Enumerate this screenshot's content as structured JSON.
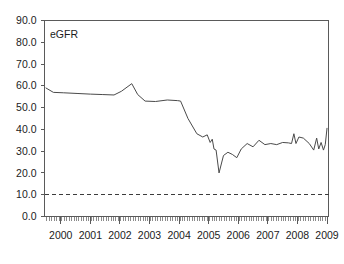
{
  "chart_data": {
    "type": "line",
    "title": "",
    "xlabel": "",
    "ylabel": "",
    "legend_position": "inside-top-left",
    "grid": false,
    "xlim": [
      1999.45,
      2009.05
    ],
    "ylim": [
      0.0,
      90.0
    ],
    "y_ticks": [
      0.0,
      10.0,
      20.0,
      30.0,
      40.0,
      50.0,
      60.0,
      70.0,
      80.0,
      90.0
    ],
    "y_tick_labels": [
      "0.0",
      "10.0",
      "20.0",
      "30.0",
      "40.0",
      "50.0",
      "60.0",
      "70.0",
      "80.0",
      "90.0"
    ],
    "x_ticks": [
      2000,
      2001,
      2002,
      2003,
      2004,
      2005,
      2006,
      2007,
      2008,
      2009
    ],
    "x_tick_labels": [
      "2000",
      "2001",
      "2002",
      "2003",
      "2004",
      "2005",
      "2006",
      "2007",
      "2008",
      "2009"
    ],
    "x_minor_tick_interval": 0.0833,
    "reference_lines": [
      {
        "name": "ckd-threshold",
        "orientation": "horizontal",
        "value": 10.0,
        "style": "dashed"
      }
    ],
    "series": [
      {
        "name": "eGFR",
        "label": "eGFR",
        "color": "#4a4a4a",
        "x": [
          1999.5,
          1999.75,
          2000.1,
          2000.55,
          2001.0,
          2001.4,
          2001.8,
          2002.05,
          2002.4,
          2002.6,
          2002.85,
          2003.2,
          2003.6,
          2003.95,
          2004.05,
          2004.3,
          2004.6,
          2004.8,
          2004.95,
          2005.05,
          2005.12,
          2005.18,
          2005.25,
          2005.35,
          2005.5,
          2005.65,
          2005.8,
          2005.95,
          2006.1,
          2006.3,
          2006.5,
          2006.7,
          2006.9,
          2007.1,
          2007.3,
          2007.5,
          2007.7,
          2007.8,
          2007.88,
          2007.95,
          2008.05,
          2008.2,
          2008.4,
          2008.55,
          2008.65,
          2008.72,
          2008.8,
          2008.88,
          2008.94,
          2009.0
        ],
        "y": [
          59.0,
          57.0,
          56.8,
          56.5,
          56.2,
          56.0,
          55.8,
          57.5,
          61.0,
          56.0,
          53.0,
          52.8,
          53.5,
          53.2,
          53.0,
          45.0,
          38.0,
          36.5,
          37.5,
          34.0,
          35.5,
          31.0,
          30.5,
          20.0,
          28.0,
          29.5,
          28.5,
          27.0,
          31.0,
          33.5,
          32.0,
          35.0,
          33.0,
          33.5,
          33.0,
          34.0,
          33.8,
          33.5,
          38.0,
          33.5,
          36.5,
          36.0,
          33.5,
          30.5,
          36.0,
          31.0,
          34.0,
          30.5,
          33.0,
          40.5
        ],
        "min_value": 20.0,
        "max_value": 61.0,
        "start_value": 59.0,
        "end_value": 40.5
      }
    ]
  },
  "legend": {
    "entries": [
      {
        "label": "eGFR"
      }
    ]
  }
}
